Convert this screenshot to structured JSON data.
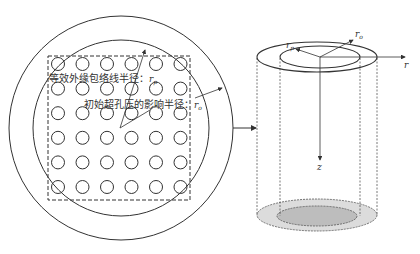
{
  "left_panel": {
    "label_envelope": "等效外缘包络线半径：",
    "label_envelope_symbol": "r",
    "label_envelope_subscript": "p",
    "label_influence": "初始超孔压的影响半径：",
    "label_influence_symbol": "r",
    "label_influence_subscript": "o",
    "pile_grid": {
      "rows": 6,
      "cols": 6
    }
  },
  "right_panel": {
    "axis_r_label": "r",
    "axis_z_label": "z",
    "radius_inner_symbol": "r",
    "radius_inner_subscript": "p",
    "radius_outer_symbol": "r",
    "radius_outer_subscript": "o"
  },
  "colors": {
    "stroke": "#333333",
    "outer_annulus_fill": "#dcdcdc",
    "inner_core_fill": "#bdbdbd"
  }
}
